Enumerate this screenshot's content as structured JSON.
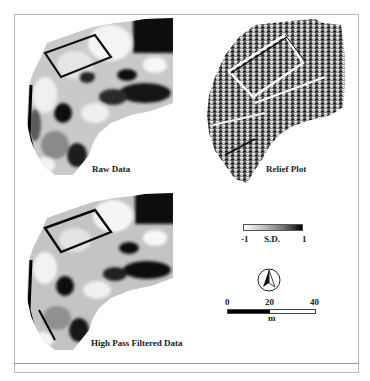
{
  "figure": {
    "panels": [
      {
        "id": "raw",
        "label": "Raw Data"
      },
      {
        "id": "relief",
        "label": "Relief Plot"
      },
      {
        "id": "highpass",
        "label": "High Pass Filtered Data"
      }
    ],
    "legend": {
      "min_label": "-1",
      "unit_label": "S.D.",
      "max_label": "1",
      "gradient_start": "#ffffff",
      "gradient_end": "#000000"
    },
    "north_arrow": {
      "icon": "north-arrow-icon"
    },
    "scale_bar": {
      "ticks": [
        "0",
        "20",
        "40"
      ],
      "unit": "m"
    }
  }
}
